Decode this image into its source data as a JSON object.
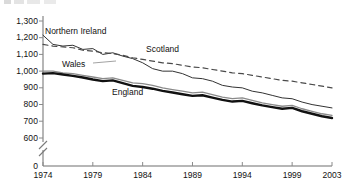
{
  "chart_data": {
    "type": "line",
    "title": "",
    "xlabel": "",
    "ylabel": "",
    "grid": false,
    "legend_position": "inline-labels",
    "axis_break": true,
    "axis_break_note": "y-axis broken between 0 and 600",
    "ylim": [
      600,
      1300
    ],
    "yticks": [
      "0",
      "600",
      "700",
      "800",
      "900",
      "1,000",
      "1,100",
      "1,200",
      "1,300"
    ],
    "xlim": [
      1974,
      2003
    ],
    "xticks": [
      "1974",
      "1979",
      "1984",
      "1989",
      "1994",
      "1999",
      "2003"
    ],
    "x": [
      1974,
      1975,
      1976,
      1977,
      1978,
      1979,
      1980,
      1981,
      1982,
      1983,
      1984,
      1985,
      1986,
      1987,
      1988,
      1989,
      1990,
      1991,
      1992,
      1993,
      1994,
      1995,
      1996,
      1997,
      1998,
      1999,
      2000,
      2001,
      2002,
      2003
    ],
    "series": [
      {
        "name": "Northern Ireland",
        "style": "thin-solid",
        "color": "#333333",
        "values": [
          1215,
          1160,
          1150,
          1155,
          1130,
          1135,
          1100,
          1110,
          1090,
          1075,
          1050,
          1015,
          1000,
          1000,
          985,
          960,
          955,
          940,
          915,
          905,
          900,
          880,
          870,
          855,
          840,
          835,
          815,
          800,
          790,
          780
        ]
      },
      {
        "name": "Wales",
        "style": "medium-grey",
        "color": "#8a8a8a",
        "values": [
          1000,
          1000,
          990,
          985,
          975,
          965,
          955,
          960,
          945,
          930,
          925,
          915,
          900,
          890,
          880,
          870,
          875,
          860,
          845,
          835,
          840,
          825,
          810,
          800,
          790,
          795,
          775,
          760,
          745,
          735
        ]
      },
      {
        "name": "Scotland",
        "style": "dashed",
        "color": "#4a4a4a",
        "values": [
          1160,
          1150,
          1145,
          1140,
          1125,
          1120,
          1110,
          1105,
          1095,
          1080,
          1070,
          1060,
          1050,
          1045,
          1035,
          1025,
          1020,
          1010,
          1000,
          990,
          985,
          975,
          965,
          955,
          945,
          940,
          930,
          920,
          910,
          900
        ]
      },
      {
        "name": "England",
        "style": "thick-solid",
        "color": "#111111",
        "values": [
          985,
          988,
          980,
          972,
          962,
          950,
          940,
          945,
          928,
          912,
          905,
          895,
          882,
          872,
          862,
          852,
          856,
          842,
          828,
          818,
          822,
          808,
          795,
          785,
          775,
          780,
          760,
          745,
          730,
          720
        ]
      }
    ],
    "series_labels": [
      {
        "text": "Northern Ireland",
        "x": 45,
        "y": 26
      },
      {
        "text": "Wales",
        "x": 62,
        "y": 59
      },
      {
        "text": "Scotland",
        "x": 146,
        "y": 44
      },
      {
        "text": "England",
        "x": 112,
        "y": 87
      }
    ]
  }
}
